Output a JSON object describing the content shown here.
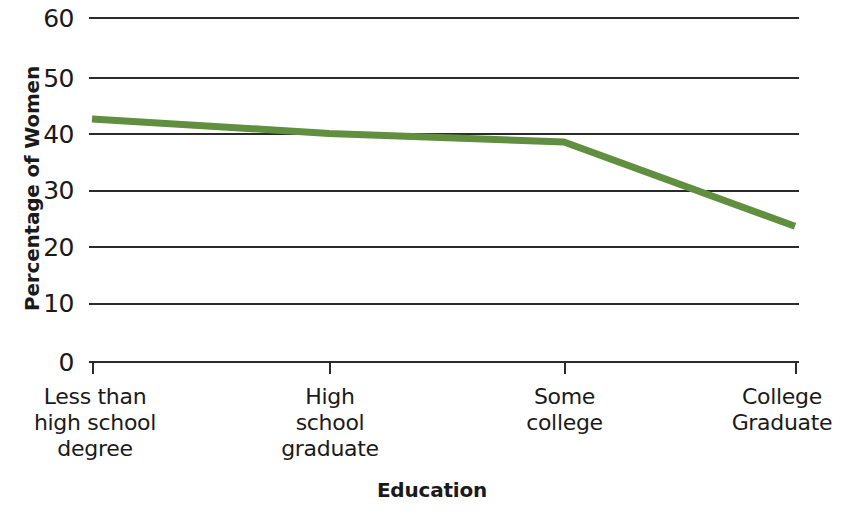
{
  "chart_data": {
    "type": "line",
    "title": "",
    "xlabel": "Education",
    "ylabel": "Percentage of Women",
    "categories": [
      "Less than\nhigh school\ndegree",
      "High\nschool\ngraduate",
      "Some\ncollege",
      "College\nGraduate"
    ],
    "values": [
      42.2,
      39.7,
      38.2,
      23.5
    ],
    "series": [
      {
        "name": "Percentage of Women",
        "values": [
          42.2,
          39.7,
          38.2,
          23.5
        ],
        "color": "#5f8f3f"
      }
    ],
    "ylim": [
      0,
      60
    ],
    "yticks": [
      0,
      10,
      20,
      30,
      40,
      50,
      60
    ],
    "ytick_labels": [
      "0",
      "10",
      "20",
      "30",
      "40",
      "50",
      "60"
    ],
    "grid": true,
    "grid_axis": "y",
    "legend": "none",
    "line_color": "#5f8f3f",
    "axis_color": "#2b2b2b",
    "background": "#ffffff"
  },
  "axes": {
    "y_title": "Percentage of Women",
    "x_title": "Education",
    "y_tick_labels": [
      "60",
      "50",
      "40",
      "30",
      "20",
      "10",
      "0"
    ],
    "x_tick_labels": [
      "Less than\nhigh school\ndegree",
      "High\nschool\ngraduate",
      "Some\ncollege",
      "College\nGraduate"
    ]
  }
}
